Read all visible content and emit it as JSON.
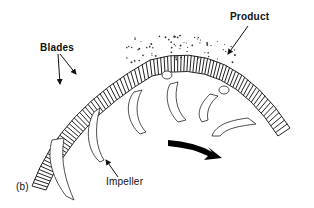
{
  "diagram": {
    "labels": {
      "blades": "Blades",
      "product": "Product",
      "impeller": "Impeller",
      "subfigure": "(b)"
    },
    "components": [
      {
        "id": "blade-ring",
        "description": "Curved ring of radial blades (arc)"
      },
      {
        "id": "impeller-vanes",
        "description": "Curved impeller vanes hanging beneath the ring",
        "count": 6
      },
      {
        "id": "product-particles",
        "description": "Scattered dots above the ring representing product"
      },
      {
        "id": "rotation-arrow",
        "description": "Thick black curved arrow indicating rotation direction (clockwise, to the right)"
      }
    ],
    "colors": {
      "line": "#222222",
      "arrow": "#000000",
      "background": "#ffffff"
    }
  }
}
